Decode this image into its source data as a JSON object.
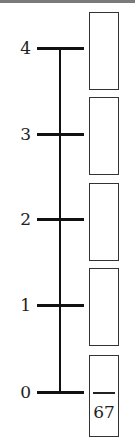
{
  "diagram": {
    "type": "number-line-with-answer-boxes",
    "ticks": [
      {
        "label": "4",
        "y": 48
      },
      {
        "label": "3",
        "y": 134
      },
      {
        "label": "2",
        "y": 219
      },
      {
        "label": "1",
        "y": 305
      },
      {
        "label": "0",
        "y": 392
      }
    ],
    "boxes": [
      {
        "numerator": "",
        "denominator": "",
        "top": 12,
        "height": 78
      },
      {
        "numerator": "",
        "denominator": "",
        "top": 97,
        "height": 78
      },
      {
        "numerator": "",
        "denominator": "",
        "top": 183,
        "height": 78
      },
      {
        "numerator": "",
        "denominator": "",
        "top": 268,
        "height": 78
      },
      {
        "numerator": "",
        "denominator": "67",
        "top": 355,
        "height": 82,
        "has_fraction_bar": true
      }
    ]
  }
}
